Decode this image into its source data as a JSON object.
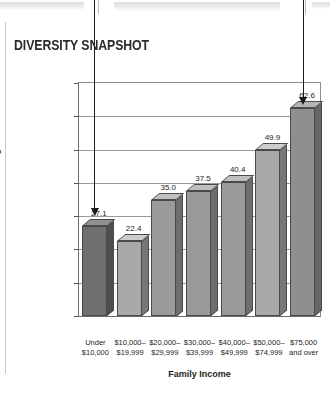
{
  "title": "DIVERSITY SNAPSHOT",
  "axis": {
    "x_title": "Family Income",
    "y_title": "Percentage of Dependent Children, 18 to 24 Years Old, Enrolled in College"
  },
  "chart_data": {
    "type": "bar",
    "title": "DIVERSITY SNAPSHOT",
    "xlabel": "Family Income",
    "ylabel": "Percentage of Dependent Children, 18 to 24 Years Old, Enrolled in College",
    "categories": [
      "Under\n$10,000",
      "$10,000–\n$19,999",
      "$20,000–\n$29,999",
      "$30,000–\n$39,999",
      "$40,000–\n$49,999",
      "$50,000–\n$74,999",
      "$75,000\nand over"
    ],
    "values": [
      27.1,
      22.4,
      35.0,
      37.5,
      40.4,
      49.9,
      62.6
    ],
    "value_labels": [
      "27.1",
      "22.4",
      "35.0",
      "37.5",
      "40.4",
      "49.9",
      "62.6"
    ],
    "ylim": [
      0,
      70
    ],
    "yticks": [
      0,
      10,
      20,
      30,
      40,
      50,
      60,
      70
    ],
    "ytick_labels": [
      "0",
      "10",
      "20",
      "30",
      "40",
      "50",
      "60",
      "70"
    ],
    "grid": true,
    "legend": "none",
    "bar_colors": [
      "#6f6f6f",
      "#a9a9a9",
      "#9a9a9a",
      "#9a9a9a",
      "#9a9a9a",
      "#a9a9a9",
      "#8f8f8f"
    ],
    "bar_side_colors": [
      "#4e4e4e",
      "#777777",
      "#6e6e6e",
      "#6e6e6e",
      "#6e6e6e",
      "#777777",
      "#666666"
    ],
    "bar_top_colors": [
      "#909090",
      "#cccccc",
      "#bfbfbf",
      "#bfbfbf",
      "#bfbfbf",
      "#cccccc",
      "#b4b4b4"
    ],
    "annotations": [
      {
        "name": "arrow-to-under-10000",
        "target_category": "Under\n$10,000",
        "direction": "down"
      },
      {
        "name": "arrow-to-75000-and-over",
        "target_category": "$75,000\nand over",
        "direction": "down"
      }
    ]
  }
}
